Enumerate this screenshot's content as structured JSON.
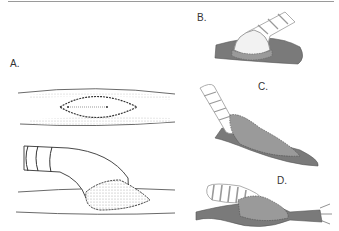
{
  "figure": {
    "panels": [
      {
        "id": "A",
        "label": "A.",
        "description": "Side-to-side anastomosis opening (top) and end-to-side graft with striped tube (bottom), line drawing"
      },
      {
        "id": "B",
        "label": "B.",
        "description": "Striped graft joined atop shaded vessel with hooded patch"
      },
      {
        "id": "C",
        "label": "C.",
        "description": "Striped graft entering vessel at steep angle with elongated hood"
      },
      {
        "id": "D",
        "label": "D.",
        "description": "Striped graft joining vessel with branched ends"
      }
    ]
  },
  "colors": {
    "vessel_shade": "#7a7a7a",
    "hood_shade": "#9a9a9a",
    "line": "#333333",
    "stipple": "#bdbdbd"
  }
}
